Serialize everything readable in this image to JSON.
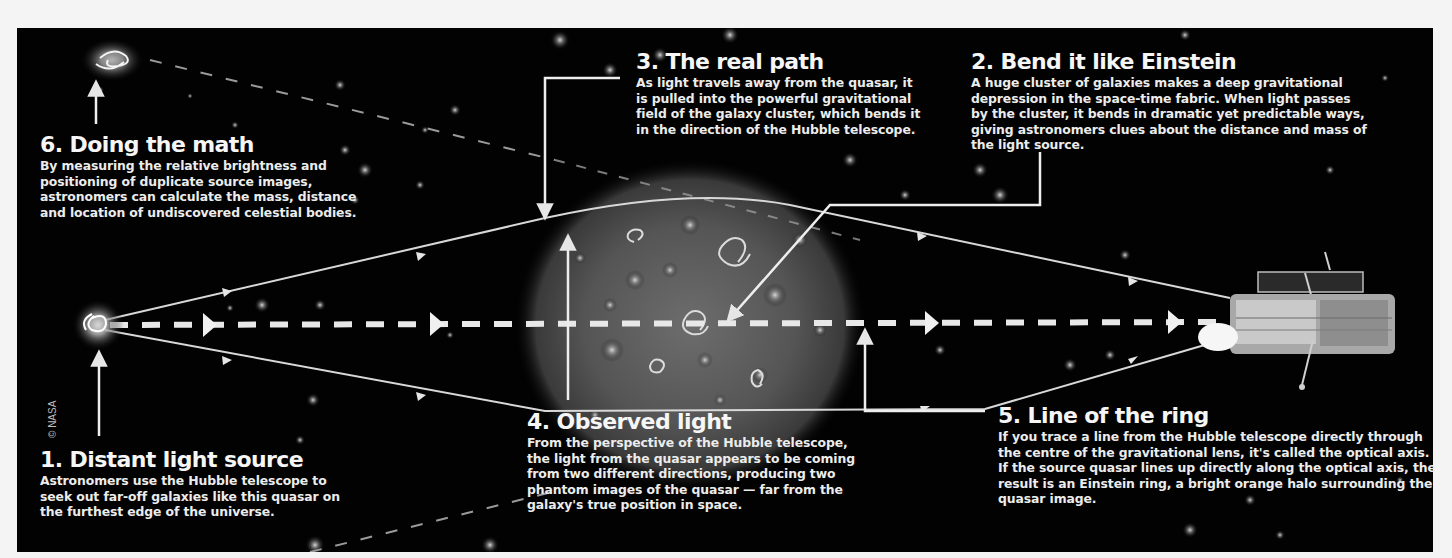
{
  "diagram": {
    "credit": "© NASA",
    "colors": {
      "background": "#020202",
      "text": "#f2f2f2",
      "lines": "#dcdcdc",
      "frame": "#f4f4f4"
    },
    "nodes": [
      {
        "id": "quasar",
        "label": "Distant light source (quasar)"
      },
      {
        "id": "cluster",
        "label": "Galaxy cluster (gravitational lens)"
      },
      {
        "id": "hubble",
        "label": "Hubble telescope"
      },
      {
        "id": "phantom-top",
        "label": "Phantom image (upper)"
      }
    ],
    "edges": [
      {
        "from": "quasar",
        "to": "hubble",
        "style": "dashed",
        "label": "Optical axis"
      },
      {
        "from": "quasar",
        "to": "hubble",
        "style": "solid",
        "label": "Real path (upper, bent by cluster)"
      },
      {
        "from": "quasar",
        "to": "hubble",
        "style": "solid",
        "label": "Real path (lower)"
      }
    ],
    "steps": [
      {
        "number": "1.",
        "title": "1. Distant light source",
        "body": "Astronomers use the Hubble telescope to seek out far-off galaxies like this quasar on the furthest edge of the universe."
      },
      {
        "number": "2.",
        "title": "2. Bend it like Einstein",
        "body": "A huge cluster of galaxies makes a deep gravitational depression in the space-time fabric. When light passes by the cluster, it bends in dramatic yet predictable ways, giving astronomers clues about the distance and mass of the light source."
      },
      {
        "number": "3.",
        "title": "3. The real path",
        "body": "As light travels away from the quasar, it is pulled into the powerful gravitational field of the galaxy cluster, which bends it in the direction of the Hubble telescope."
      },
      {
        "number": "4.",
        "title": "4. Observed light",
        "body": "From the perspective of the Hubble telescope, the light from the quasar appears to be coming from two different directions, producing two phantom images of the quasar — far from the galaxy's true position in space."
      },
      {
        "number": "5.",
        "title": "5. Line of the ring",
        "body": "If you trace a line from the Hubble telescope directly through the centre of the gravitational lens, it's called the optical axis. If the source quasar lines up directly along the optical axis, the result is an Einstein ring, a bright orange halo surrounding the quasar image."
      },
      {
        "number": "6.",
        "title": "6. Doing the math",
        "body": "By measuring the relative brightness and positioning of duplicate source images, astronomers can calculate the mass, distance and location of undiscovered celestial bodies."
      }
    ]
  }
}
